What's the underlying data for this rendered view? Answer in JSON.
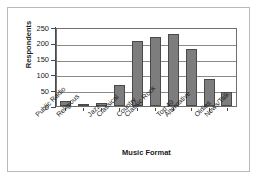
{
  "chart_data": {
    "type": "bar",
    "title": "",
    "xlabel": "Music Format",
    "ylabel": "Respondents",
    "categories": [
      "Public Radio",
      "Religious",
      "Jazz",
      "Classical",
      "Country",
      "Classic Rock",
      "Top 40",
      "Alternative",
      "Oldies",
      "News/Talk"
    ],
    "values": [
      15,
      8,
      10,
      67,
      210,
      225,
      235,
      185,
      88,
      44
    ],
    "ylim": [
      0,
      250
    ],
    "yticks": [
      0,
      50,
      100,
      150,
      200,
      250
    ],
    "ytick_labels": [
      "0",
      "50",
      "100",
      "150",
      "200",
      "250"
    ],
    "grid": true,
    "grid_axis": "y",
    "legend": null,
    "bar_color": "#7d7d7d",
    "bar_edge_color": "#4a4a4a",
    "axis_color": "#4a4a4a",
    "grid_color": "#8a8a8a",
    "background": "#ffffff"
  }
}
